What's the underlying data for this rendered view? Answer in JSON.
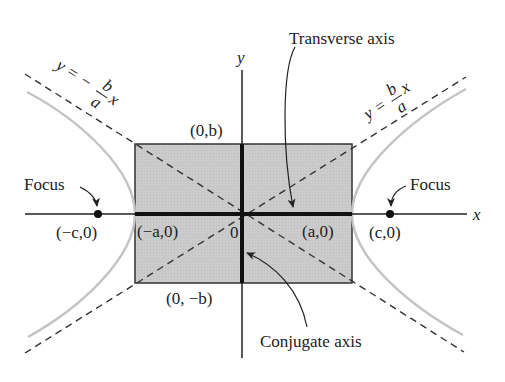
{
  "diagram": {
    "axes": {
      "x_label": "x",
      "y_label": "y",
      "origin_label": "0"
    },
    "labels": {
      "transverse_axis": "Transverse axis",
      "conjugate_axis": "Conjugate axis",
      "focus_left": "Focus",
      "focus_right": "Focus",
      "point_neg_c": "(−c,0)",
      "point_neg_a": "(−a,0)",
      "point_a": "(a,0)",
      "point_c": "(c,0)",
      "point_b": "(0,b)",
      "point_neg_b": "(0, −b)"
    },
    "asymptotes": {
      "positive": {
        "prefix": "y =",
        "num": "b",
        "den": "a",
        "suffix": "x"
      },
      "negative": {
        "prefix": "y = −",
        "num": "b",
        "den": "a",
        "suffix": "x"
      }
    },
    "colors": {
      "box_fill": "#c8c8c8",
      "hyperbola": "#c4c4c4",
      "ink": "#222222"
    }
  }
}
